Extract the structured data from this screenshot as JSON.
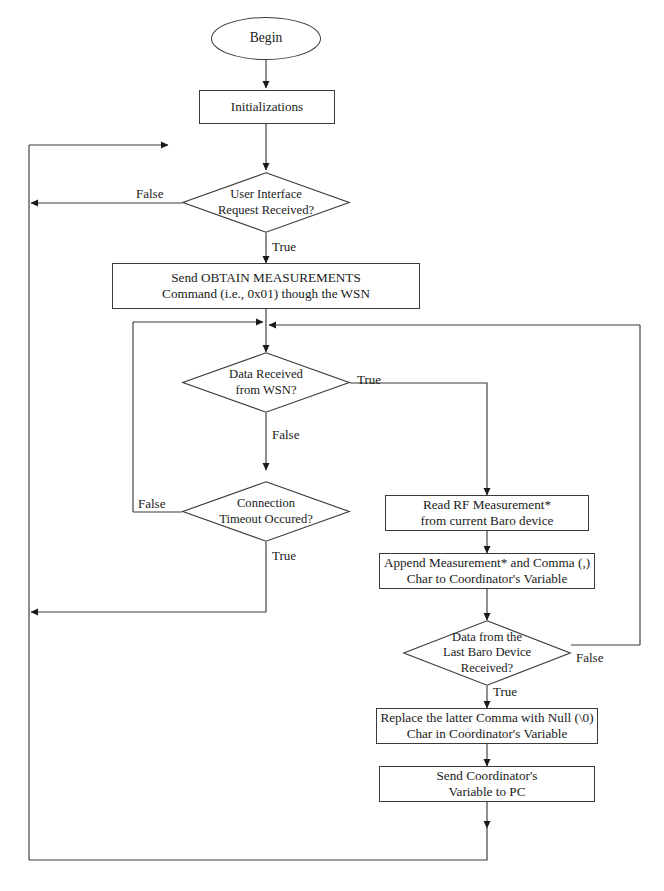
{
  "diagram": {
    "stroke_color": "#3a3a3a",
    "text_color": "#1a1a1a",
    "background": "#ffffff",
    "nodes": {
      "begin": {
        "label": "Begin",
        "shape": "terminal"
      },
      "initializations": {
        "label": "Initializations",
        "shape": "process"
      },
      "ui_request": {
        "label": "User Interface\nRequest Received?",
        "shape": "decision"
      },
      "send_obtain": {
        "label": "Send OBTAIN MEASUREMENTS\nCommand (i.e., 0x01) though the WSN",
        "shape": "process"
      },
      "data_received": {
        "label": "Data Received\nfrom WSN?",
        "shape": "decision"
      },
      "timeout": {
        "label": "Connection\nTimeout Occured?",
        "shape": "decision"
      },
      "read_rf": {
        "label": "Read RF Measurement*\nfrom current Baro device",
        "shape": "process"
      },
      "append_meas": {
        "label": "Append Measurement* and Comma (,)\nChar to Coordinator's Variable",
        "shape": "process"
      },
      "last_baro": {
        "label": "Data from the\nLast Baro Device\nReceived?",
        "shape": "decision"
      },
      "replace_comma": {
        "label": "Replace the latter Comma with Null (\\0)\nChar in Coordinator's Variable",
        "shape": "process"
      },
      "send_pc": {
        "label": "Send Coordinator's\nVariable to PC",
        "shape": "process"
      }
    },
    "edge_labels": {
      "ui_false": "False",
      "ui_true": "True",
      "data_true": "True",
      "data_false": "False",
      "timeout_false": "False",
      "timeout_true": "True",
      "baro_false": "False",
      "baro_true": "True"
    }
  }
}
